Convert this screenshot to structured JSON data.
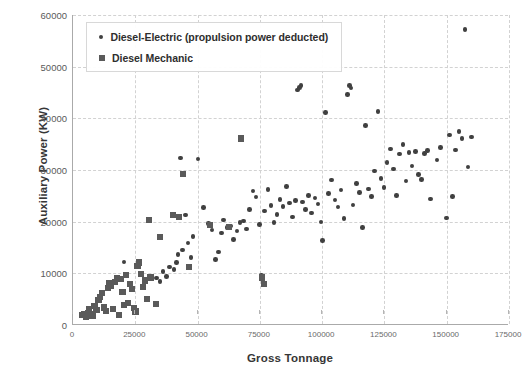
{
  "chart_data": {
    "type": "scatter",
    "title": "",
    "xlabel": "Gross Tonnage",
    "ylabel": "Auxiliary Power (KW)",
    "xlim": [
      0,
      175000
    ],
    "ylim": [
      0,
      60000
    ],
    "xticks": [
      0,
      25000,
      50000,
      75000,
      100000,
      125000,
      150000,
      175000
    ],
    "yticks": [
      0,
      10000,
      20000,
      30000,
      40000,
      50000,
      60000
    ],
    "xtick_labels": [
      "0",
      "25000",
      "50000",
      "75000",
      "100000",
      "125000",
      "150000",
      "175000"
    ],
    "ytick_labels": [
      "0",
      "10000",
      "20000",
      "30000",
      "40000",
      "50000",
      "60000"
    ],
    "grid": true,
    "legend_position": "top-left",
    "marker_color": "#404040",
    "grid_color": "#d2d2d2",
    "axis_color": "#aaaaaa",
    "series": [
      {
        "name": "Diesel-Electric (propulsion power deducted)",
        "marker": "circle",
        "color": "#404040",
        "points": [
          [
            20500,
            12200
          ],
          [
            33400,
            9100
          ],
          [
            35000,
            8400
          ],
          [
            36200,
            10400
          ],
          [
            37500,
            9400
          ],
          [
            38800,
            11200
          ],
          [
            40600,
            10700
          ],
          [
            41500,
            12100
          ],
          [
            42200,
            13600
          ],
          [
            43100,
            32300
          ],
          [
            44000,
            14500
          ],
          [
            45200,
            21300
          ],
          [
            46100,
            15900
          ],
          [
            47400,
            13100
          ],
          [
            48200,
            17100
          ],
          [
            50100,
            32100
          ],
          [
            52300,
            22700
          ],
          [
            54500,
            19600
          ],
          [
            55800,
            18400
          ],
          [
            57200,
            12700
          ],
          [
            58400,
            14100
          ],
          [
            59600,
            17800
          ],
          [
            60500,
            20300
          ],
          [
            61800,
            18900
          ],
          [
            63200,
            19200
          ],
          [
            64500,
            16500
          ],
          [
            65800,
            18200
          ],
          [
            67100,
            19800
          ],
          [
            68400,
            20100
          ],
          [
            69700,
            18600
          ],
          [
            70900,
            22400
          ],
          [
            72300,
            25900
          ],
          [
            73500,
            24800
          ],
          [
            74800,
            19400
          ],
          [
            75600,
            9600
          ],
          [
            76900,
            22100
          ],
          [
            78200,
            26200
          ],
          [
            79400,
            23100
          ],
          [
            80600,
            19800
          ],
          [
            81900,
            21400
          ],
          [
            83100,
            24300
          ],
          [
            84300,
            22900
          ],
          [
            85600,
            26800
          ],
          [
            86800,
            23600
          ],
          [
            88100,
            20900
          ],
          [
            89400,
            24100
          ],
          [
            90200,
            45500
          ],
          [
            90800,
            46000
          ],
          [
            91500,
            46400
          ],
          [
            92100,
            23800
          ],
          [
            93400,
            22300
          ],
          [
            94600,
            25100
          ],
          [
            95800,
            21700
          ],
          [
            97100,
            24600
          ],
          [
            98300,
            23400
          ],
          [
            99500,
            19900
          ],
          [
            100200,
            16400
          ],
          [
            101400,
            41100
          ],
          [
            102600,
            25400
          ],
          [
            103800,
            28100
          ],
          [
            105100,
            24200
          ],
          [
            106300,
            22800
          ],
          [
            107600,
            26100
          ],
          [
            108800,
            20600
          ],
          [
            110100,
            44600
          ],
          [
            110900,
            46300
          ],
          [
            111600,
            45900
          ],
          [
            112400,
            23200
          ],
          [
            113700,
            27400
          ],
          [
            114900,
            25700
          ],
          [
            116200,
            18900
          ],
          [
            117400,
            38600
          ],
          [
            118600,
            26300
          ],
          [
            119900,
            24900
          ],
          [
            121100,
            29800
          ],
          [
            122400,
            41300
          ],
          [
            123600,
            28400
          ],
          [
            124900,
            26600
          ],
          [
            126100,
            31400
          ],
          [
            127400,
            34100
          ],
          [
            128600,
            30200
          ],
          [
            129900,
            25100
          ],
          [
            131100,
            33100
          ],
          [
            132400,
            34900
          ],
          [
            133600,
            27900
          ],
          [
            134900,
            33400
          ],
          [
            136100,
            30800
          ],
          [
            137400,
            33600
          ],
          [
            138600,
            29100
          ],
          [
            139900,
            28200
          ],
          [
            141100,
            33200
          ],
          [
            142400,
            33800
          ],
          [
            143600,
            24400
          ],
          [
            146100,
            31900
          ],
          [
            147400,
            34400
          ],
          [
            149900,
            20700
          ],
          [
            151100,
            36800
          ],
          [
            152400,
            24900
          ],
          [
            153600,
            33900
          ],
          [
            154900,
            37500
          ],
          [
            156100,
            36100
          ],
          [
            157400,
            57200
          ],
          [
            158600,
            30600
          ],
          [
            159900,
            36400
          ]
        ]
      },
      {
        "name": "Diesel Mechanic",
        "marker": "square",
        "color": "#5a5a5a",
        "points": [
          [
            3800,
            1900
          ],
          [
            4600,
            2100
          ],
          [
            5200,
            1600
          ],
          [
            5900,
            2400
          ],
          [
            6400,
            3100
          ],
          [
            7100,
            2200
          ],
          [
            7800,
            1800
          ],
          [
            8600,
            3600
          ],
          [
            9400,
            2900
          ],
          [
            10200,
            4900
          ],
          [
            10900,
            5400
          ],
          [
            11600,
            6200
          ],
          [
            12400,
            3400
          ],
          [
            13100,
            2700
          ],
          [
            13900,
            7100
          ],
          [
            14600,
            8100
          ],
          [
            15400,
            7600
          ],
          [
            16100,
            3100
          ],
          [
            16900,
            8400
          ],
          [
            17600,
            9100
          ],
          [
            18400,
            2000
          ],
          [
            19100,
            8900
          ],
          [
            19900,
            6400
          ],
          [
            20600,
            3900
          ],
          [
            21400,
            9600
          ],
          [
            22100,
            4200
          ],
          [
            22900,
            7900
          ],
          [
            23600,
            6900
          ],
          [
            24400,
            3300
          ],
          [
            25100,
            2600
          ],
          [
            25900,
            11400
          ],
          [
            26600,
            12100
          ],
          [
            27400,
            9900
          ],
          [
            28100,
            7400
          ],
          [
            28900,
            8600
          ],
          [
            29600,
            5100
          ],
          [
            30400,
            20400
          ],
          [
            31100,
            9200
          ],
          [
            33400,
            4100
          ],
          [
            34900,
            17100
          ],
          [
            40200,
            21300
          ],
          [
            42400,
            20900
          ],
          [
            44100,
            29300
          ],
          [
            46600,
            11200
          ],
          [
            55100,
            19400
          ],
          [
            62600,
            18900
          ],
          [
            67400,
            36100
          ],
          [
            75900,
            9200
          ],
          [
            76600,
            7900
          ]
        ]
      }
    ]
  },
  "legend": {
    "items": [
      {
        "label": "Diesel-Electric (propulsion power deducted)",
        "marker": "circle"
      },
      {
        "label": "Diesel Mechanic",
        "marker": "square"
      }
    ]
  }
}
